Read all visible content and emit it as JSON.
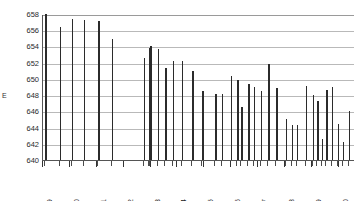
{
  "chart_data": {
    "type": "bar",
    "title": "",
    "xlabel": "",
    "ylabel": "E",
    "ylim": [
      640,
      658
    ],
    "ytick_step": 2,
    "yticks": [
      658,
      656,
      654,
      652,
      650,
      648,
      646,
      644,
      642,
      640
    ],
    "ytick_labels": [
      "658",
      "656",
      "654",
      "652",
      "650",
      "648",
      "646",
      "644",
      "642",
      "640"
    ],
    "xtick_labels": [
      "1979",
      "1980",
      "1981",
      "1982",
      "1983",
      "1984",
      "1985",
      "1986",
      "1987",
      "1988",
      "1989",
      "1990"
    ],
    "xlim": [
      1979.0,
      1990.6
    ],
    "grid": "horizontal",
    "legend": "none",
    "bar_color": "#2b2b2b",
    "grid_color": "#b9b9b9",
    "axis_color": "#555555",
    "background": "#ffffff",
    "note": "Irregularly spaced event bars plotted against a time axis; each bar is a discrete event with an E value.",
    "points": [
      {
        "x": 1979.08,
        "y": 658.0
      },
      {
        "x": 1979.62,
        "y": 656.4
      },
      {
        "x": 1980.07,
        "y": 657.4
      },
      {
        "x": 1980.52,
        "y": 657.3
      },
      {
        "x": 1981.05,
        "y": 657.2
      },
      {
        "x": 1981.55,
        "y": 654.9
      },
      {
        "x": 1982.75,
        "y": 652.6
      },
      {
        "x": 1982.93,
        "y": 653.8
      },
      {
        "x": 1982.99,
        "y": 654.0
      },
      {
        "x": 1983.27,
        "y": 653.7
      },
      {
        "x": 1983.55,
        "y": 651.3
      },
      {
        "x": 1983.82,
        "y": 652.2
      },
      {
        "x": 1984.16,
        "y": 652.2
      },
      {
        "x": 1984.55,
        "y": 651.0
      },
      {
        "x": 1984.93,
        "y": 648.5
      },
      {
        "x": 1985.4,
        "y": 648.2
      },
      {
        "x": 1985.64,
        "y": 648.2
      },
      {
        "x": 1985.98,
        "y": 650.3
      },
      {
        "x": 1986.22,
        "y": 649.9
      },
      {
        "x": 1986.38,
        "y": 646.5
      },
      {
        "x": 1986.62,
        "y": 649.4
      },
      {
        "x": 1986.84,
        "y": 649.0
      },
      {
        "x": 1987.1,
        "y": 648.5
      },
      {
        "x": 1987.38,
        "y": 651.8
      },
      {
        "x": 1987.68,
        "y": 648.9
      },
      {
        "x": 1988.02,
        "y": 645.0
      },
      {
        "x": 1988.25,
        "y": 644.3
      },
      {
        "x": 1988.44,
        "y": 644.3
      },
      {
        "x": 1988.76,
        "y": 649.1
      },
      {
        "x": 1989.02,
        "y": 648.0
      },
      {
        "x": 1989.2,
        "y": 647.3
      },
      {
        "x": 1989.36,
        "y": 642.6
      },
      {
        "x": 1989.54,
        "y": 648.6
      },
      {
        "x": 1989.74,
        "y": 649.0
      },
      {
        "x": 1989.95,
        "y": 644.4
      },
      {
        "x": 1990.14,
        "y": 642.2
      },
      {
        "x": 1990.36,
        "y": 646.0
      }
    ]
  }
}
